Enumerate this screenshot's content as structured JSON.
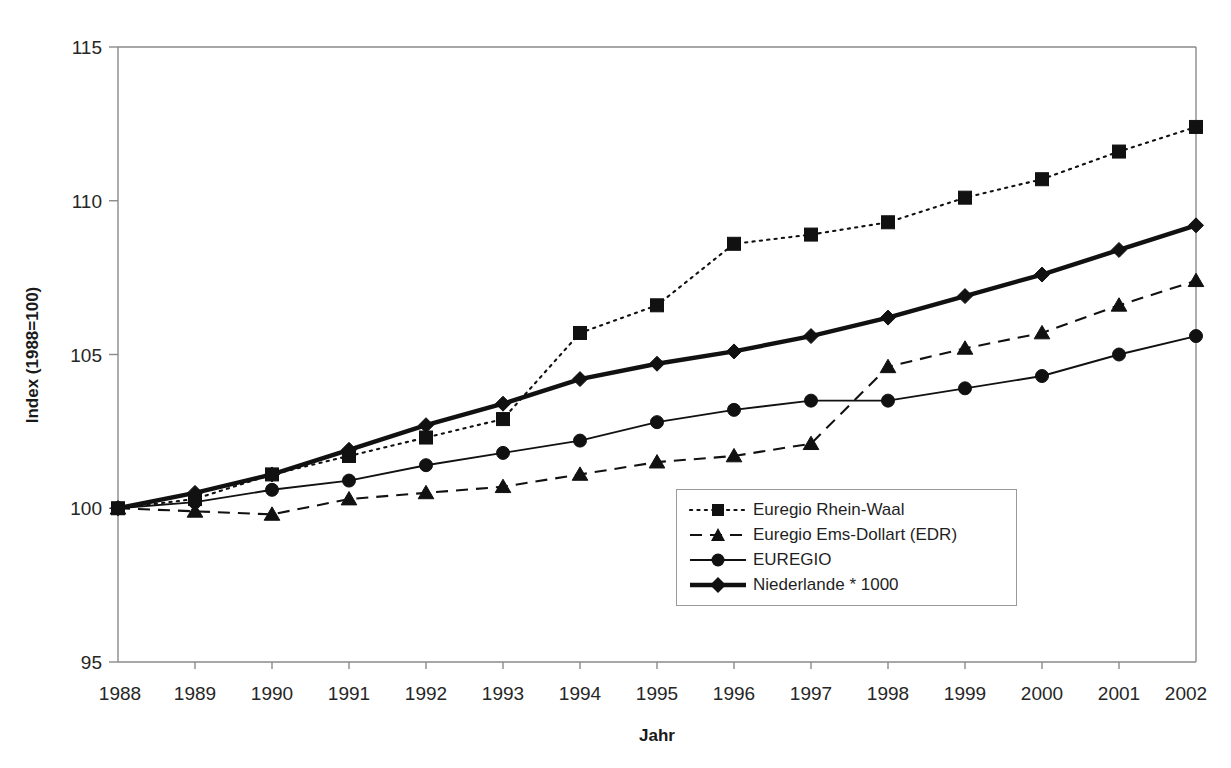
{
  "chart_data": {
    "type": "line",
    "title": "",
    "xlabel": "Jahr",
    "ylabel": "Index (1988=100)",
    "x": [
      1988,
      1989,
      1990,
      1991,
      1992,
      1993,
      1994,
      1995,
      1996,
      1997,
      1998,
      1999,
      2000,
      2001,
      2002
    ],
    "x_tick_labels": [
      "1988",
      "1989",
      "1990",
      "1991",
      "1992",
      "1993",
      "1994",
      "1995",
      "1996",
      "1997",
      "1998",
      "1999",
      "2000",
      "2001",
      "2002"
    ],
    "y_tick_labels": [
      "95",
      "100",
      "105",
      "110",
      "115"
    ],
    "y_ticks": [
      95,
      100,
      105,
      110,
      115
    ],
    "ylim": [
      95,
      115
    ],
    "xlim": [
      1988,
      2002
    ],
    "grid": false,
    "legend_position": "inside-center-bottom",
    "series": [
      {
        "name": "Euregio Rhein-Waal",
        "marker": "square",
        "line_style": "dotted",
        "line_width": "thin",
        "color": "#111111",
        "values": [
          100.0,
          100.3,
          101.1,
          101.7,
          102.3,
          102.9,
          105.7,
          106.6,
          108.6,
          108.9,
          109.3,
          110.1,
          110.7,
          111.6,
          112.4
        ]
      },
      {
        "name": "Euregio Ems-Dollart (EDR)",
        "marker": "triangle",
        "line_style": "dashed",
        "line_width": "thin",
        "color": "#111111",
        "values": [
          100.0,
          99.9,
          99.8,
          100.3,
          100.5,
          100.7,
          101.1,
          101.5,
          101.7,
          102.1,
          104.6,
          105.2,
          105.7,
          106.6,
          107.4
        ]
      },
      {
        "name": "EUREGIO",
        "marker": "circle",
        "line_style": "solid",
        "line_width": "thin",
        "color": "#111111",
        "values": [
          100.0,
          100.2,
          100.6,
          100.9,
          101.4,
          101.8,
          102.2,
          102.8,
          103.2,
          103.5,
          103.5,
          103.9,
          104.3,
          105.0,
          105.6
        ]
      },
      {
        "name": "Niederlande * 1000",
        "marker": "diamond",
        "line_style": "solid",
        "line_width": "thick",
        "color": "#111111",
        "values": [
          100.0,
          100.5,
          101.1,
          101.9,
          102.7,
          103.4,
          104.2,
          104.7,
          105.1,
          105.6,
          106.2,
          106.9,
          107.6,
          108.4,
          109.2
        ]
      }
    ]
  },
  "legend": {
    "entries": [
      {
        "label": "Euregio Rhein-Waal"
      },
      {
        "label": "Euregio Ems-Dollart (EDR)"
      },
      {
        "label": "EUREGIO"
      },
      {
        "label": "Niederlande * 1000"
      }
    ]
  }
}
